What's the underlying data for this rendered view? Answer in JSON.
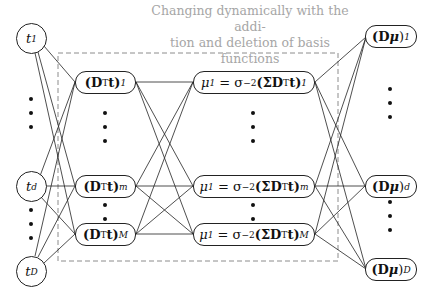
{
  "caption": {
    "line1": "Changing dynamically with the addi-",
    "line2": "tion and deletion of basis functions"
  },
  "colors": {
    "caption": "#a6a6a6",
    "dashed_box": "#8c8c8c",
    "lines": "#222222"
  },
  "input_layer": {
    "nodes": [
      {
        "label": "t",
        "sub": "1"
      },
      {
        "label": "t",
        "sub": "d"
      },
      {
        "label": "t",
        "sub": "D"
      }
    ]
  },
  "hidden_layer_1": {
    "nodes": [
      {
        "prefix": "(D",
        "sup": "T",
        "mid": "t)",
        "sub": "1"
      },
      {
        "prefix": "(D",
        "sup": "T",
        "mid": "t)",
        "sub": "m"
      },
      {
        "prefix": "(D",
        "sup": "T",
        "mid": "t)",
        "sub": "M"
      }
    ]
  },
  "hidden_layer_2": {
    "nodes": [
      {
        "lhs": "μ",
        "lhs_sub": "1",
        "eq": " = σ",
        "sup1": "−2",
        "open": "(ΣD",
        "sup2": "T",
        "mid": "t)",
        "sub": "1"
      },
      {
        "lhs": "μ",
        "lhs_sub": "1",
        "eq": " = σ",
        "sup1": "−2",
        "open": "(ΣD",
        "sup2": "T",
        "mid": "t)",
        "sub": "m"
      },
      {
        "lhs": "μ",
        "lhs_sub": "1",
        "eq": " = σ",
        "sup1": "−2",
        "open": "(ΣD",
        "sup2": "T",
        "mid": "t)",
        "sub": "M"
      }
    ]
  },
  "output_layer": {
    "nodes": [
      {
        "prefix": "(D",
        "mu": "μ",
        "close": ")",
        "sub": "1"
      },
      {
        "prefix": "(D",
        "mu": "μ",
        "close": ")",
        "sub": "d"
      },
      {
        "prefix": "(D",
        "mu": "μ",
        "close": ")",
        "sub": "D"
      }
    ]
  }
}
